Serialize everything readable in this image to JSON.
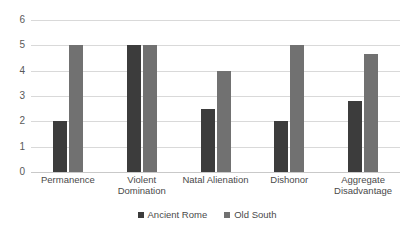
{
  "chart_data": {
    "type": "bar",
    "title": "",
    "subtitle": "",
    "xlabel": "",
    "ylabel": "",
    "ylim": [
      0,
      6
    ],
    "yticks": [
      0,
      1,
      2,
      3,
      4,
      5,
      6
    ],
    "ytick_labels": [
      "0",
      "1",
      "2",
      "3",
      "4",
      "5",
      "6"
    ],
    "grid": true,
    "legend_position": "bottom-center",
    "categories": [
      "Permanence",
      "Violent Domination",
      "Natal Alienation",
      "Dishonor",
      "Aggregate\nDisadvantage"
    ],
    "series": [
      {
        "name": "Ancient Rome",
        "color": "#3c3c3c",
        "values": [
          2.0,
          5.0,
          2.5,
          2.0,
          2.8
        ]
      },
      {
        "name": "Old South",
        "color": "#717171",
        "values": [
          5.0,
          5.0,
          4.0,
          5.0,
          4.67
        ]
      }
    ]
  },
  "legend": {
    "items": [
      {
        "label": "Ancient Rome",
        "color": "#3c3c3c"
      },
      {
        "label": "Old South",
        "color": "#717171"
      }
    ]
  },
  "colors": {
    "series_ancient_rome": "#3c3c3c",
    "series_old_south": "#717171",
    "gridline": "#d9d9d9",
    "axis_text": "#595959",
    "background": "#ffffff"
  }
}
